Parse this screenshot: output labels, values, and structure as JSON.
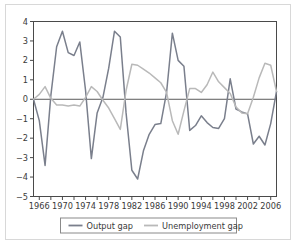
{
  "chart_data": {
    "type": "line",
    "title": "",
    "xlabel": "",
    "ylabel": "",
    "xlim": [
      1965,
      2007
    ],
    "ylim": [
      -5,
      4
    ],
    "yticks": [
      4,
      3,
      2,
      1,
      0,
      -1,
      -2,
      -3,
      -4,
      -5
    ],
    "ytick_labels": [
      "4",
      "3",
      "2",
      "1",
      "0",
      "−1",
      "−2",
      "−3",
      "−4",
      "−5"
    ],
    "xticks": [
      1966,
      1968,
      1970,
      1972,
      1974,
      1976,
      1978,
      1980,
      1982,
      1984,
      1986,
      1988,
      1990,
      1992,
      1994,
      1996,
      1998,
      2000,
      2002,
      2004,
      2006
    ],
    "xtick_labels": [
      "1966",
      "",
      "1970",
      "",
      "1974",
      "",
      "1978",
      "",
      "1982",
      "",
      "1986",
      "",
      "1990",
      "",
      "1994",
      "",
      "1998",
      "",
      "2002",
      "",
      "2006"
    ],
    "grid": false,
    "zero_line": true,
    "legend_position": "bottom",
    "x": [
      1965,
      1966,
      1967,
      1968,
      1969,
      1970,
      1971,
      1972,
      1973,
      1974,
      1975,
      1976,
      1977,
      1978,
      1979,
      1980,
      1981,
      1982,
      1983,
      1984,
      1985,
      1986,
      1987,
      1988,
      1989,
      1990,
      1991,
      1992,
      1993,
      1994,
      1995,
      1996,
      1997,
      1998,
      1999,
      2000,
      2001,
      2002,
      2003,
      2004,
      2005,
      2006,
      2007
    ],
    "series": [
      {
        "name": "Output gap",
        "color": "#7a7f8c",
        "values": [
          0.0,
          -1.1,
          -3.4,
          0.2,
          2.7,
          3.5,
          2.4,
          2.25,
          2.95,
          0.45,
          -3.05,
          -0.7,
          0.1,
          1.6,
          3.5,
          3.2,
          -0.7,
          -3.65,
          -4.1,
          -2.65,
          -1.8,
          -1.3,
          -1.25,
          0.35,
          3.4,
          2.0,
          1.7,
          -1.6,
          -1.35,
          -0.85,
          -1.2,
          -1.45,
          -1.5,
          -1.0,
          1.05,
          -0.5,
          -0.65,
          -0.75,
          -2.3,
          -1.9,
          -2.35,
          -1.25,
          0.4
        ]
      },
      {
        "name": "Unemployment gap",
        "color": "#b9b9b9",
        "values": [
          0.0,
          0.25,
          0.65,
          0.05,
          -0.3,
          -0.3,
          -0.35,
          -0.3,
          -0.35,
          0.1,
          0.65,
          0.4,
          -0.05,
          -0.45,
          -1.0,
          -1.55,
          0.45,
          1.8,
          1.75,
          1.55,
          1.35,
          1.1,
          0.85,
          0.35,
          -1.1,
          -1.8,
          -0.6,
          0.55,
          0.55,
          0.35,
          0.75,
          1.4,
          0.9,
          0.6,
          0.3,
          -0.4,
          -0.7,
          -0.75,
          0.1,
          1.1,
          1.85,
          1.75,
          0.4
        ]
      }
    ],
    "legend": [
      {
        "label": "Output gap",
        "color": "#7a7f8c"
      },
      {
        "label": "Unemployment gap",
        "color": "#b9b9b9"
      }
    ]
  },
  "style": {
    "axis_color": "#4a4a4a",
    "zero_line_color": "#5a5a5a",
    "frame_color": "#d8d8d8",
    "text_color": "#3a3a3a",
    "background": "#ffffff"
  }
}
